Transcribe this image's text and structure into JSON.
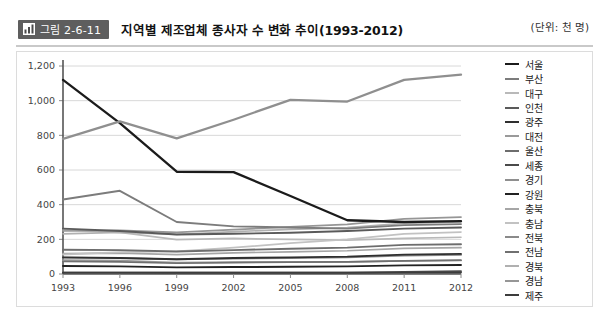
{
  "header": {
    "badge_label": "그림 2-6-11",
    "badge_icon": "bar-chart-icon",
    "title": "지역별 제조업체 종사자 수 변화 추이(1993-2012)",
    "unit_note": "(단위: 천 명)",
    "badge_bg": "#5e5e5e"
  },
  "chart_data": {
    "type": "line",
    "title": "지역별 제조업체 종사자 수 변화 추이(1993-2012)",
    "xlabel": "",
    "ylabel": "",
    "unit": "천 명",
    "legend_position": "right",
    "grid": true,
    "x": [
      "1993",
      "1996",
      "1999",
      "2002",
      "2005",
      "2008",
      "2011",
      "2012"
    ],
    "categories": [
      "1993",
      "1996",
      "1999",
      "2002",
      "2005",
      "2008",
      "2011",
      "2012"
    ],
    "yticks": [
      "0",
      "200",
      "400",
      "600",
      "800",
      "1,000",
      "1,200"
    ],
    "ytick_values": [
      0,
      200,
      400,
      600,
      800,
      1000,
      1200
    ],
    "ylim": [
      0,
      1200
    ],
    "series": [
      {
        "name": "서울",
        "color": "#1b1b1b",
        "width": 2.3,
        "values": [
          1120,
          870,
          590,
          588,
          450,
          310,
          300,
          305
        ]
      },
      {
        "name": "부산",
        "color": "#7c7c7c",
        "width": 1.9,
        "values": [
          430,
          480,
          300,
          275,
          268,
          262,
          282,
          288
        ]
      },
      {
        "name": "대구",
        "color": "#b9b9b9",
        "width": 1.7,
        "values": [
          255,
          240,
          198,
          205,
          200,
          196,
          205,
          212
        ]
      },
      {
        "name": "인천",
        "color": "#5a5a5a",
        "width": 1.9,
        "values": [
          262,
          248,
          228,
          232,
          238,
          248,
          262,
          268
        ]
      },
      {
        "name": "광주",
        "color": "#2f2f2f",
        "width": 1.9,
        "values": [
          96,
          92,
          85,
          92,
          96,
          100,
          112,
          116
        ]
      },
      {
        "name": "대전",
        "color": "#9a9a9a",
        "width": 1.7,
        "values": [
          80,
          78,
          66,
          68,
          68,
          70,
          76,
          78
        ]
      },
      {
        "name": "울산",
        "color": "#6d6d6d",
        "width": 1.9,
        "values": [
          140,
          138,
          130,
          138,
          146,
          152,
          168,
          172
        ]
      },
      {
        "name": "세종",
        "color": "#4a4a4a",
        "width": 1.9,
        "values": [
          8,
          8,
          8,
          8,
          8,
          8,
          12,
          16
        ]
      },
      {
        "name": "경기",
        "color": "#8f8f8f",
        "width": 2.3,
        "values": [
          780,
          880,
          782,
          890,
          1005,
          995,
          1120,
          1150
        ]
      },
      {
        "name": "강원",
        "color": "#222222",
        "width": 1.9,
        "values": [
          46,
          44,
          38,
          40,
          42,
          44,
          50,
          52
        ]
      },
      {
        "name": "충북",
        "color": "#a6a6a6",
        "width": 1.7,
        "values": [
          118,
          120,
          112,
          122,
          128,
          134,
          148,
          152
        ]
      },
      {
        "name": "충남",
        "color": "#c2c2c2",
        "width": 1.7,
        "values": [
          112,
          126,
          130,
          152,
          178,
          200,
          232,
          242
        ]
      },
      {
        "name": "전북",
        "color": "#8a8a8a",
        "width": 1.7,
        "values": [
          94,
          92,
          84,
          88,
          92,
          96,
          106,
          110
        ]
      },
      {
        "name": "전남",
        "color": "#707070",
        "width": 1.7,
        "values": [
          72,
          70,
          62,
          66,
          68,
          70,
          76,
          80
        ]
      },
      {
        "name": "경북",
        "color": "#b0b0b0",
        "width": 1.7,
        "values": [
          232,
          240,
          228,
          244,
          258,
          268,
          292,
          300
        ]
      },
      {
        "name": "경남",
        "color": "#969696",
        "width": 1.7,
        "values": [
          248,
          252,
          240,
          256,
          272,
          286,
          318,
          328
        ]
      },
      {
        "name": "제주",
        "color": "#3c3c3c",
        "width": 1.9,
        "values": [
          8,
          8,
          7,
          7,
          7,
          7,
          8,
          8
        ]
      }
    ]
  }
}
